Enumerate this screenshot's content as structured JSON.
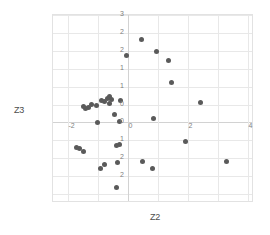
{
  "chart_data": {
    "type": "scatter",
    "title": "",
    "xlabel": "Z2",
    "ylabel": "Z3",
    "xlim": [
      -2.5,
      4.2
    ],
    "ylim": [
      -2.25,
      3.0
    ],
    "grid": true,
    "legend": null,
    "xticks": [
      -2,
      0,
      2,
      4
    ],
    "xtick_labels": [
      "-2",
      "0",
      "2",
      "4"
    ],
    "x_gridlines": [
      -2,
      -1,
      0,
      1,
      2,
      3,
      4
    ],
    "yticks": [
      3,
      2.5,
      2,
      1.5,
      1,
      0.5,
      0,
      -0.5,
      -1,
      -1.5,
      -2
    ],
    "ytick_labels": [
      "3",
      "2",
      "2",
      "1",
      "1",
      "0",
      "0",
      "1",
      "2",
      "2",
      ""
    ],
    "point_color": "#5a5a5a",
    "grid_color": "#e8e8e8",
    "axis_color": "#d2d2d2",
    "points": [
      {
        "x": 0.45,
        "y": 2.32
      },
      {
        "x": 0.95,
        "y": 1.97
      },
      {
        "x": 1.35,
        "y": 1.73
      },
      {
        "x": -0.04,
        "y": 1.88
      },
      {
        "x": 1.45,
        "y": 1.12
      },
      {
        "x": 2.42,
        "y": 0.55
      },
      {
        "x": -0.25,
        "y": 0.62
      },
      {
        "x": -0.55,
        "y": 0.63
      },
      {
        "x": -0.62,
        "y": 0.72
      },
      {
        "x": -0.7,
        "y": 0.68
      },
      {
        "x": -0.78,
        "y": 0.58
      },
      {
        "x": -0.88,
        "y": 0.6
      },
      {
        "x": -1.05,
        "y": 0.48
      },
      {
        "x": -1.22,
        "y": 0.5
      },
      {
        "x": -1.32,
        "y": 0.42
      },
      {
        "x": -1.42,
        "y": 0.4
      },
      {
        "x": -1.5,
        "y": 0.44
      },
      {
        "x": -0.62,
        "y": 0.52
      },
      {
        "x": -0.46,
        "y": 0.22
      },
      {
        "x": -0.28,
        "y": 0.02
      },
      {
        "x": -1.02,
        "y": 0.0
      },
      {
        "x": 0.85,
        "y": 0.12
      },
      {
        "x": 1.92,
        "y": -0.52
      },
      {
        "x": -0.28,
        "y": -0.62
      },
      {
        "x": -0.38,
        "y": -0.64
      },
      {
        "x": -1.62,
        "y": -0.72
      },
      {
        "x": -1.72,
        "y": -0.7
      },
      {
        "x": -1.5,
        "y": -0.82
      },
      {
        "x": -0.35,
        "y": -1.12
      },
      {
        "x": -0.78,
        "y": -1.18
      },
      {
        "x": -0.92,
        "y": -1.3
      },
      {
        "x": 0.48,
        "y": -1.1
      },
      {
        "x": 0.82,
        "y": -1.3
      },
      {
        "x": 3.28,
        "y": -1.1
      },
      {
        "x": -0.38,
        "y": -1.82
      }
    ]
  },
  "axes": {
    "y_title": "Z3",
    "x_title": "Z2"
  }
}
